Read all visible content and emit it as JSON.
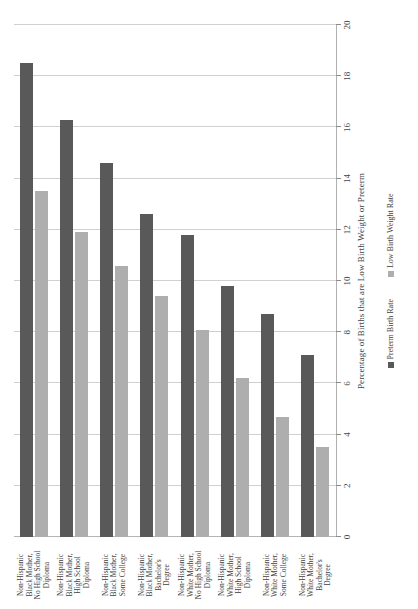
{
  "chart_data": {
    "type": "bar",
    "orientation": "horizontal",
    "title": "",
    "xlabel": "Percentage of Births that are Low Birth Weight or Preterm",
    "ylabel": "",
    "xlim": [
      0,
      20
    ],
    "xticks": [
      0,
      2,
      4,
      6,
      8,
      10,
      12,
      14,
      16,
      18,
      20
    ],
    "xtick_labels": [
      "0",
      "2",
      "4",
      "6",
      "8",
      "10",
      "12",
      "14",
      "16",
      "18",
      "20"
    ],
    "grid": true,
    "legend_position": "bottom",
    "categories": [
      "Non-Hispanic Black Mother, No High School Diploma",
      "Non-Hispanic Black Mother, High School Diploma",
      "Non-Hispanic Black Mother, Some College",
      "Non-Hispanic Black Mother, Bachelor's Degree",
      "Non-Hispanic White Mother, No High School Diploma",
      "Non-Hispanic White Mother, High School Diploma",
      "Non-Hispanic White Mother, Some College",
      "Non-Hispanic White Mother, Bachelor's Degree"
    ],
    "category_lines": [
      [
        "Non-Hispanic",
        "Black Mother,",
        "No High School",
        "Diploma"
      ],
      [
        "Non-Hispanic",
        "Black Mother,",
        "High School",
        "Diploma"
      ],
      [
        "Non-Hispanic",
        "Black Mother,",
        "Some College"
      ],
      [
        "Non-Hispanic",
        "Black Mother,",
        "Bachelor's",
        "Degree"
      ],
      [
        "Non-Hispanic",
        "White Mother,",
        "No High School",
        "Diploma"
      ],
      [
        "Non-Hispanic",
        "White Mother,",
        "High School",
        "Diploma"
      ],
      [
        "Non-Hispanic",
        "White Mother,",
        "Some College"
      ],
      [
        "Non-Hispanic",
        "White Mother,",
        "Bachelor's",
        "Degree"
      ]
    ],
    "series": [
      {
        "name": "Preterm Birth Rate",
        "color": "#595959",
        "values": [
          18.5,
          16.3,
          14.6,
          12.6,
          11.8,
          9.8,
          8.7,
          7.1
        ]
      },
      {
        "name": "Low Birth Weight Rate",
        "color": "#aeaeae",
        "values": [
          13.5,
          11.9,
          10.6,
          9.4,
          8.1,
          6.2,
          4.7,
          3.5
        ]
      }
    ]
  },
  "legend": {
    "items": [
      {
        "label": "Preterm Birth Rate",
        "color": "#595959"
      },
      {
        "label": "Low Birth Weight Rate",
        "color": "#aeaeae"
      }
    ]
  },
  "axis": {
    "title": "Percentage of Births that are Low Birth Weight or Preterm"
  }
}
